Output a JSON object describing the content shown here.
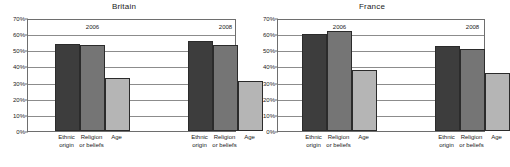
{
  "chart_data": {
    "type": "bar",
    "title": "",
    "panels": [
      {
        "title": "Britain",
        "groups": [
          {
            "label": "2006",
            "categories": [
              "Ethnic origin",
              "Religion or beliefs",
              "Age"
            ],
            "values": [
              54,
              53,
              33
            ]
          },
          {
            "label": "2008",
            "categories": [
              "Ethnic origin",
              "Religion or beliefs",
              "Age"
            ],
            "values": [
              55.5,
              53.5,
              31
            ]
          }
        ]
      },
      {
        "title": "France",
        "groups": [
          {
            "label": "2006",
            "categories": [
              "Ethnic origin",
              "Religion or beliefs",
              "Age"
            ],
            "values": [
              60,
              62,
              38
            ]
          },
          {
            "label": "2008",
            "categories": [
              "Ethnic origin",
              "Religion or beliefs",
              "Age"
            ],
            "values": [
              52.5,
              51,
              36
            ]
          }
        ]
      }
    ],
    "categories": [
      "Ethnic origin",
      "Religion or beliefs",
      "Age"
    ],
    "category_lines": [
      [
        "Ethnic",
        "origin"
      ],
      [
        "Religion",
        "or beliefs"
      ],
      [
        "Age",
        ""
      ]
    ],
    "series": [
      {
        "name": "Ethnic origin",
        "color": "#3d3d3d"
      },
      {
        "name": "Religion or beliefs",
        "color": "#757575"
      },
      {
        "name": "Age",
        "color": "#b5b5b5"
      }
    ],
    "xlabel": "",
    "ylabel": "",
    "ylim": [
      0,
      70
    ],
    "ytick_step": 10,
    "ytick_labels": [
      "0%",
      "10%",
      "20%",
      "30%",
      "40%",
      "50%",
      "60%",
      "70%"
    ],
    "ytick_values": [
      0,
      10,
      20,
      30,
      40,
      50,
      60,
      70
    ],
    "grid": true,
    "legend": "none",
    "value_suffix": "%"
  }
}
